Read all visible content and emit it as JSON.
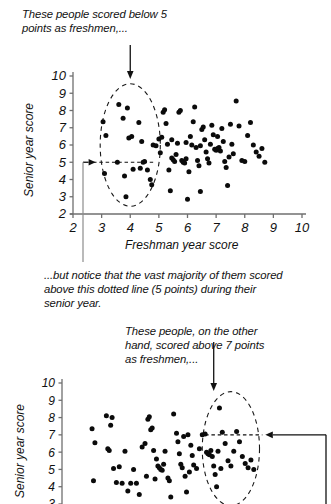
{
  "figure": {
    "panel1": {
      "annotation_top": "These people scored below 5\npoints as freshmen,...",
      "xlabel": "Freshman year score",
      "ylabel": "Senior year score",
      "xticks": [
        "2",
        "3",
        "4",
        "5",
        "6",
        "7",
        "8",
        "9",
        "10"
      ],
      "yticks": [
        "10",
        "9",
        "8",
        "7",
        "6",
        "5",
        "4",
        "3",
        "2"
      ]
    },
    "middle_note": "...but notice that the vast majority of them scored\nabove this dotted line (5 points) during their\nsenior year.",
    "panel2": {
      "annotation_top": "These people, on the other\nhand, scored above 7 points\nas freshmen,...",
      "ylabel": "Senior year score",
      "yticks": [
        "10",
        "9",
        "8",
        "7",
        "6",
        "5",
        "4",
        "3"
      ]
    }
  },
  "chart_data": [
    {
      "type": "scatter",
      "title": "",
      "xlabel": "Freshman year score",
      "ylabel": "Senior year score",
      "xlim": [
        2,
        10
      ],
      "ylim": [
        2,
        10
      ],
      "xticks": [
        2,
        3,
        4,
        5,
        6,
        7,
        8,
        9,
        10
      ],
      "yticks": [
        2,
        3,
        4,
        5,
        6,
        7,
        8,
        9,
        10
      ],
      "grid": false,
      "legend": null,
      "annotations": [
        {
          "text": "These people scored below 5 points as freshmen,...",
          "type": "arrow-label",
          "points_to": [
            4.0,
            9.6
          ]
        },
        {
          "text": "dashed reference line at y = 5",
          "type": "hline",
          "y": 5,
          "x_from": 2.7,
          "x_to": 4.8
        },
        {
          "text": "dashed highlight ellipse around freshmen scoring below 5",
          "type": "ellipse",
          "cx": 4.0,
          "cy": 6.0,
          "rx": 1.05,
          "ry": 3.55
        }
      ],
      "points": [
        [
          3.05,
          7.35
        ],
        [
          3.15,
          6.55
        ],
        [
          3.1,
          4.35
        ],
        [
          3.55,
          5.0
        ],
        [
          3.6,
          8.35
        ],
        [
          3.75,
          7.55
        ],
        [
          3.9,
          8.15
        ],
        [
          3.95,
          6.4
        ],
        [
          4.05,
          6.5
        ],
        [
          3.8,
          4.2
        ],
        [
          3.85,
          3.0
        ],
        [
          4.1,
          4.6
        ],
        [
          4.35,
          4.65
        ],
        [
          4.3,
          7.3
        ],
        [
          4.4,
          6.2
        ],
        [
          4.5,
          5.05
        ],
        [
          4.45,
          5.0
        ],
        [
          4.6,
          4.55
        ],
        [
          4.7,
          4.0
        ],
        [
          4.75,
          3.7
        ],
        [
          4.8,
          6.0
        ],
        [
          4.9,
          5.95
        ],
        [
          5.0,
          6.35
        ],
        [
          5.05,
          5.55
        ],
        [
          5.15,
          7.9
        ],
        [
          5.2,
          8.05
        ],
        [
          5.25,
          7.25
        ],
        [
          5.3,
          6.05
        ],
        [
          5.35,
          4.55
        ],
        [
          5.4,
          3.35
        ],
        [
          5.45,
          5.25
        ],
        [
          5.5,
          5.15
        ],
        [
          5.55,
          5.05
        ],
        [
          5.6,
          5.45
        ],
        [
          5.65,
          6.1
        ],
        [
          5.7,
          7.9
        ],
        [
          5.75,
          8.0
        ],
        [
          5.8,
          5.1
        ],
        [
          5.85,
          5.0
        ],
        [
          5.9,
          4.95
        ],
        [
          5.95,
          5.2
        ],
        [
          6.0,
          2.85
        ],
        [
          6.05,
          4.45
        ],
        [
          6.1,
          6.5
        ],
        [
          6.15,
          6.0
        ],
        [
          6.2,
          7.35
        ],
        [
          6.25,
          8.2
        ],
        [
          6.3,
          5.85
        ],
        [
          6.35,
          5.1
        ],
        [
          6.4,
          4.8
        ],
        [
          6.45,
          3.3
        ],
        [
          6.5,
          6.9
        ],
        [
          6.55,
          7.05
        ],
        [
          6.6,
          6.3
        ],
        [
          6.65,
          5.6
        ],
        [
          6.7,
          5.2
        ],
        [
          6.75,
          4.95
        ],
        [
          6.8,
          6.05
        ],
        [
          6.85,
          7.15
        ],
        [
          6.9,
          6.6
        ],
        [
          6.95,
          5.75
        ],
        [
          7.0,
          5.7
        ],
        [
          7.05,
          5.8
        ],
        [
          7.1,
          5.85
        ],
        [
          7.15,
          5.65
        ],
        [
          7.2,
          6.95
        ],
        [
          7.25,
          6.2
        ],
        [
          7.3,
          5.05
        ],
        [
          7.35,
          4.7
        ],
        [
          7.4,
          3.65
        ],
        [
          7.45,
          5.3
        ],
        [
          7.5,
          7.2
        ],
        [
          7.55,
          6.05
        ],
        [
          7.6,
          5.5
        ],
        [
          7.7,
          8.55
        ],
        [
          7.8,
          7.1
        ],
        [
          7.9,
          5.1
        ],
        [
          8.0,
          5.05
        ],
        [
          8.1,
          6.55
        ],
        [
          8.2,
          7.3
        ],
        [
          8.3,
          6.0
        ],
        [
          8.4,
          5.6
        ],
        [
          8.5,
          5.35
        ],
        [
          8.6,
          5.8
        ],
        [
          8.7,
          5.0
        ],
        [
          5.1,
          6.45
        ],
        [
          5.45,
          6.3
        ],
        [
          5.95,
          6.15
        ],
        [
          6.45,
          5.95
        ],
        [
          7.05,
          6.5
        ]
      ]
    },
    {
      "type": "scatter",
      "title": "",
      "xlabel": "",
      "ylabel": "Senior year score",
      "xlim": [
        2,
        10
      ],
      "ylim": [
        3,
        10
      ],
      "xticks": [],
      "yticks": [
        3,
        4,
        5,
        6,
        7,
        8,
        9,
        10
      ],
      "grid": false,
      "legend": null,
      "annotations": [
        {
          "text": "These people, on the other hand, scored above 7 points as freshmen,...",
          "type": "arrow-label",
          "points_to": [
            7.3,
            9.3
          ]
        },
        {
          "text": "dashed reference line at y = 7",
          "type": "hline",
          "y": 7,
          "x_from": 7.0,
          "x_to": 9.0
        },
        {
          "text": "dashed highlight ellipse around freshmen scoring above 7",
          "type": "ellipse",
          "cx": 7.9,
          "cy": 6.2,
          "rx": 1.0,
          "ry": 3.3
        }
      ],
      "points": [
        [
          3.05,
          7.35
        ],
        [
          3.15,
          6.55
        ],
        [
          3.1,
          4.35
        ],
        [
          3.55,
          8.1
        ],
        [
          3.7,
          7.55
        ],
        [
          3.75,
          8.0
        ],
        [
          3.6,
          6.2
        ],
        [
          3.65,
          6.1
        ],
        [
          3.8,
          5.05
        ],
        [
          3.9,
          4.25
        ],
        [
          4.0,
          5.15
        ],
        [
          4.1,
          4.2
        ],
        [
          4.2,
          6.05
        ],
        [
          4.3,
          3.75
        ],
        [
          4.4,
          4.2
        ],
        [
          4.5,
          5.0
        ],
        [
          4.6,
          4.2
        ],
        [
          4.7,
          3.55
        ],
        [
          4.8,
          6.3
        ],
        [
          4.9,
          6.5
        ],
        [
          5.0,
          7.9
        ],
        [
          5.05,
          8.05
        ],
        [
          5.1,
          7.3
        ],
        [
          5.15,
          7.4
        ],
        [
          5.2,
          6.1
        ],
        [
          5.3,
          5.6
        ],
        [
          5.35,
          5.2
        ],
        [
          5.4,
          5.1
        ],
        [
          5.45,
          5.0
        ],
        [
          5.5,
          4.95
        ],
        [
          5.55,
          5.3
        ],
        [
          5.6,
          6.05
        ],
        [
          5.7,
          4.5
        ],
        [
          5.75,
          4.35
        ],
        [
          5.8,
          3.4
        ],
        [
          5.9,
          8.2
        ],
        [
          6.0,
          7.1
        ],
        [
          6.05,
          6.6
        ],
        [
          6.1,
          5.9
        ],
        [
          6.15,
          5.3
        ],
        [
          6.2,
          5.1
        ],
        [
          6.3,
          4.6
        ],
        [
          6.35,
          3.7
        ],
        [
          6.4,
          7.0
        ],
        [
          6.5,
          6.4
        ],
        [
          6.55,
          5.8
        ],
        [
          6.6,
          5.25
        ],
        [
          6.7,
          5.05
        ],
        [
          6.8,
          6.2
        ],
        [
          6.9,
          7.0
        ],
        [
          7.0,
          7.05
        ],
        [
          7.05,
          6.0
        ],
        [
          7.1,
          5.9
        ],
        [
          7.15,
          5.85
        ],
        [
          7.2,
          6.1
        ],
        [
          7.25,
          5.75
        ],
        [
          7.3,
          5.2
        ],
        [
          7.35,
          4.7
        ],
        [
          7.4,
          4.0
        ],
        [
          7.45,
          6.05
        ],
        [
          7.5,
          8.55
        ],
        [
          7.6,
          7.15
        ],
        [
          7.7,
          6.5
        ],
        [
          7.8,
          5.5
        ],
        [
          7.9,
          5.2
        ],
        [
          8.0,
          6.05
        ],
        [
          8.1,
          7.2
        ],
        [
          8.2,
          6.6
        ],
        [
          8.3,
          5.75
        ],
        [
          8.4,
          5.35
        ],
        [
          8.5,
          5.1
        ],
        [
          8.6,
          5.55
        ],
        [
          8.7,
          5.0
        ],
        [
          4.95,
          4.6
        ],
        [
          5.25,
          4.45
        ],
        [
          6.25,
          6.9
        ],
        [
          6.45,
          4.85
        ],
        [
          7.55,
          5.05
        ]
      ]
    }
  ]
}
